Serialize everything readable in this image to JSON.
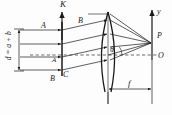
{
  "figure": {
    "kind": "optics-ray-diagram",
    "colors": {
      "ink": "#1a1a1a",
      "background": "#fdfdfd",
      "dashed": "#2a2a2a"
    }
  },
  "labels": {
    "normal_K": "K",
    "grating_slit_A_top": "A",
    "grating_slit_A_mid": "A",
    "grating_slit_B_top": "B",
    "grating_slit_B_bottom": "B",
    "grating_slit_C": "C",
    "diffraction_angle": "θ",
    "axis_y": "y",
    "focus_point_P": "P",
    "origin_O": "O",
    "focal_length_f": "f",
    "grating_period_d": "d = a + b"
  },
  "geometry": {
    "grating_x": 62,
    "grating_top_y": 14,
    "grating_bottom_y": 72,
    "lens_x": 108,
    "lens_top_y": 12,
    "lens_bottom_y": 92,
    "focus_x": 152,
    "focus_y": 44,
    "axis_x": 152,
    "optical_axis_y": 55,
    "ray_count": 4,
    "focal_length_px": 44
  }
}
